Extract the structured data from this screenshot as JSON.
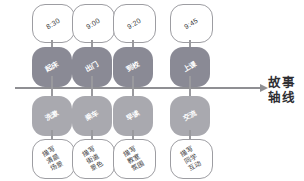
{
  "diagram": {
    "type": "story-timeline",
    "axis": {
      "label": "故事\n轴线",
      "label_line1": "故事",
      "label_line2": "轴线",
      "direction": "left-to-right",
      "color": "#8f8f93"
    },
    "colors": {
      "node_above_axis": "#8a8a95",
      "node_below_axis": "#a9a9af",
      "bubble_fill": "#ffffff",
      "bubble_stroke": "#9d9da2",
      "axis": "#8f8f93",
      "node_text": "#ffffff",
      "bubble_text": "#3c3c40"
    },
    "columns": [
      {
        "time": "8:30",
        "node_above": "起床",
        "node_below": "洗漱",
        "note": "描写 清晨 场景"
      },
      {
        "time": "9:00",
        "node_above": "出门",
        "node_below": "乘车",
        "note": "描写 街道 景色"
      },
      {
        "time": "9:20",
        "node_above": "到校",
        "node_below": "早读",
        "note": "描写 教室 氛围"
      },
      {
        "time": "9:45",
        "node_above": "上课",
        "node_below": "交流",
        "note": "描写 同学 互动"
      }
    ]
  }
}
